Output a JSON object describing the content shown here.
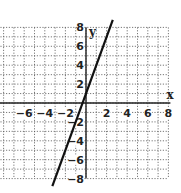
{
  "chart_data": {
    "type": "line",
    "title": "",
    "xlabel": "x",
    "ylabel": "y",
    "xlim": [
      -8,
      8
    ],
    "ylim": [
      -8,
      8
    ],
    "grid": true,
    "grid_style": "dotted",
    "x_ticks": [
      -6,
      -4,
      -2,
      2,
      4,
      6,
      8
    ],
    "y_ticks": [
      -8,
      -6,
      -4,
      -2,
      2,
      4,
      6,
      8
    ],
    "series": [
      {
        "name": "y = 3x + 1",
        "equation": "y = 3x + 1",
        "slope": 3,
        "intercept": 1,
        "x": [
          -3,
          -2,
          -1,
          0,
          1,
          2
        ],
        "y": [
          -8,
          -5,
          -2,
          1,
          4,
          7
        ],
        "color": "#111111"
      }
    ]
  },
  "labels": {
    "x_axis": "x",
    "y_axis": "y"
  }
}
